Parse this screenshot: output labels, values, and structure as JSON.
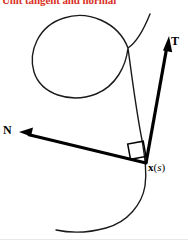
{
  "figure": {
    "title": "Unit tangent and normal",
    "title_color": "#d93025",
    "background": "#ffffff",
    "width": 188,
    "height": 240,
    "stroke_color": "#000000"
  },
  "labels": {
    "tangent": "T",
    "normal": "N",
    "point_vector": "x",
    "point_open_paren": "(",
    "point_param": "s",
    "point_close_paren": ")"
  },
  "diagram_data": {
    "type": "vector-diagram",
    "description": "Plane curve with a loop; unit tangent vector T and unit normal vector N drawn at the point x(s), meeting at a right angle.",
    "curve": {
      "name": "parametric-curve-with-loop",
      "stroke_width": 1.4,
      "stroke": "#1a1a1a"
    },
    "point": {
      "name": "x(s)",
      "x": 146,
      "y": 163
    },
    "vectors": [
      {
        "name": "T",
        "role": "unit-tangent",
        "from": [
          146,
          163
        ],
        "to": [
          168,
          42
        ],
        "stroke_width": 3.2
      },
      {
        "name": "N",
        "role": "unit-normal",
        "from": [
          146,
          163
        ],
        "to": [
          22,
          133
        ],
        "stroke_width": 3.2
      }
    ],
    "right_angle_marker": {
      "at": [
        146,
        163
      ],
      "between": [
        "T",
        "N"
      ],
      "size": 16,
      "stroke_width": 1.4
    }
  }
}
